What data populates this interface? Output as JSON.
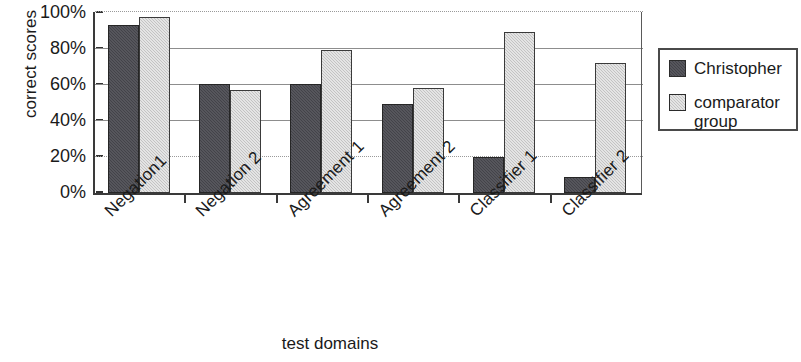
{
  "chart_data": {
    "type": "bar",
    "title": "",
    "subtitle": "",
    "xlabel": "test domains",
    "ylabel": "correct scores",
    "categories": [
      "Negation1",
      "Negation 2",
      "Agreement 1",
      "Agreement 2",
      "Classifier 1",
      "Classifier 2"
    ],
    "series": [
      {
        "name": "Christopher",
        "values": [
          93,
          60,
          60,
          49,
          20,
          9
        ],
        "color": "#434349"
      },
      {
        "name": "comparator group",
        "values": [
          97,
          57,
          79,
          58,
          89,
          72
        ],
        "color": "#c3c3c3"
      }
    ],
    "ylim": [
      0,
      100
    ],
    "ytick_labels": [
      "100%",
      "80%",
      "60%",
      "40%",
      "20%",
      "0%"
    ],
    "ytick_values": [
      100,
      80,
      60,
      40,
      20,
      0
    ],
    "grid": true,
    "grid_axis": "y",
    "legend_position": "right",
    "legend_entries": [
      "Christopher",
      "comparator group"
    ],
    "value_unit": "%"
  },
  "legend": {
    "series_1_label": "Christopher",
    "series_2_label": "comparator\ngroup"
  },
  "axes": {
    "y_title": "correct scores",
    "x_title": "test domains",
    "y_ticks": [
      "100%",
      "80%",
      "60%",
      "40%",
      "20%",
      "0%"
    ],
    "x_categories": [
      "Negation1",
      "Negation 2",
      "Agreement 1",
      "Agreement 2",
      "Classifier 1",
      "Classifier 2"
    ]
  }
}
